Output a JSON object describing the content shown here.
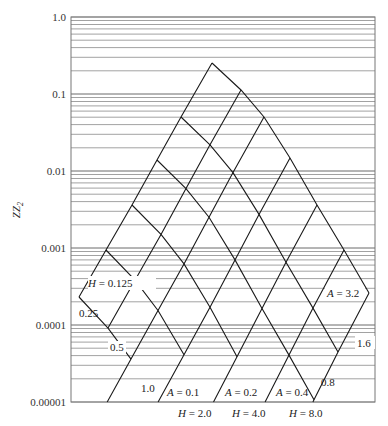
{
  "chart_data": {
    "type": "line",
    "title": "",
    "xlabel": "",
    "ylabel": "ZZ2",
    "yscale": "log",
    "ylim": [
      1e-05,
      1.0
    ],
    "y_ticks": [
      "1.0",
      "0.1",
      "0.01",
      "0.001",
      "0.0001",
      "0.00001"
    ],
    "grid": "horizontal log minor gridlines",
    "series_A": [
      {
        "name": "A = 0.1",
        "label": "A = 0.1"
      },
      {
        "name": "A = 0.2",
        "label": "A = 0.2"
      },
      {
        "name": "A = 0.4",
        "label": "A = 0.4"
      },
      {
        "name": "A = 0.8",
        "label": "0.8"
      },
      {
        "name": "A = 1.6",
        "label": "1.6"
      },
      {
        "name": "A = 3.2",
        "label": "A = 3.2"
      }
    ],
    "series_H": [
      {
        "name": "H = 0.125",
        "label": "H = 0.125"
      },
      {
        "name": "H = 0.25",
        "label": "0.25"
      },
      {
        "name": "H = 0.5",
        "label": "0.5"
      },
      {
        "name": "H = 1.0",
        "label": "1.0"
      },
      {
        "name": "H = 2.0",
        "label": "H = 2.0"
      },
      {
        "name": "H = 4.0",
        "label": "H = 4.0"
      },
      {
        "name": "H = 8.0",
        "label": "H = 8.0"
      }
    ],
    "annotations": [
      "H = 0.125",
      "0.25",
      "0.5",
      "1.0",
      "A = 0.1",
      "A = 0.2",
      "A = 0.4",
      "0.8",
      "1.6",
      "A = 3.2",
      "H = 2.0",
      "H = 4.0",
      "H = 8.0"
    ]
  },
  "axis": {
    "ylabel_main": "ZZ",
    "ylabel_sub": "2",
    "ticks": [
      {
        "label": "1.0",
        "y": 17
      },
      {
        "label": "0.1",
        "y": 94
      },
      {
        "label": "0.01",
        "y": 171
      },
      {
        "label": "0.001",
        "y": 248
      },
      {
        "label": "0.0001",
        "y": 325
      },
      {
        "label": "0.00001",
        "y": 402
      }
    ]
  },
  "labels": {
    "h0125": "H = 0.125",
    "h025": "0.25",
    "h05": "0.5",
    "h10": "1.0",
    "a01": "A = 0.1",
    "a02": "A = 0.2",
    "a04": "A = 0.4",
    "a08": "0.8",
    "a16": "1.6",
    "a32": "A = 3.2",
    "h20": "H = 2.0",
    "h40": "H = 4.0",
    "h80": "H = 8.0"
  },
  "colors": {
    "grid": "#8a8a8a",
    "frame": "#777777",
    "curve": "#1a1a1a",
    "text": "#222222"
  }
}
